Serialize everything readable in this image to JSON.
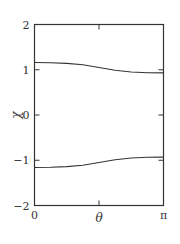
{
  "chart_data": {
    "type": "line",
    "title": "",
    "xlabel": "θ",
    "ylabel": "χ",
    "xlim": [
      0,
      3.14159
    ],
    "ylim": [
      -2,
      2
    ],
    "x_ticks": [
      {
        "value": 0,
        "label": "0"
      },
      {
        "value": 1.5708,
        "label": ""
      },
      {
        "value": 3.14159,
        "label": "π"
      }
    ],
    "y_ticks": [
      {
        "value": 2,
        "label": "2"
      },
      {
        "value": 1,
        "label": "1"
      },
      {
        "value": 0,
        "label": "0"
      },
      {
        "value": -1,
        "label": "−1"
      },
      {
        "value": -2,
        "label": "−2"
      }
    ],
    "grid": false,
    "legend": null,
    "series": [
      {
        "name": "upper branch",
        "x": [
          0,
          0.393,
          0.785,
          1.178,
          1.571,
          1.963,
          2.356,
          2.749,
          3.142
        ],
        "y": [
          1.16,
          1.155,
          1.14,
          1.11,
          1.05,
          0.99,
          0.95,
          0.935,
          0.93
        ]
      },
      {
        "name": "lower branch",
        "x": [
          0,
          0.393,
          0.785,
          1.178,
          1.571,
          1.963,
          2.356,
          2.749,
          3.142
        ],
        "y": [
          -1.16,
          -1.155,
          -1.14,
          -1.11,
          -1.05,
          -0.99,
          -0.95,
          -0.935,
          -0.93
        ]
      }
    ],
    "color": "#333333"
  }
}
